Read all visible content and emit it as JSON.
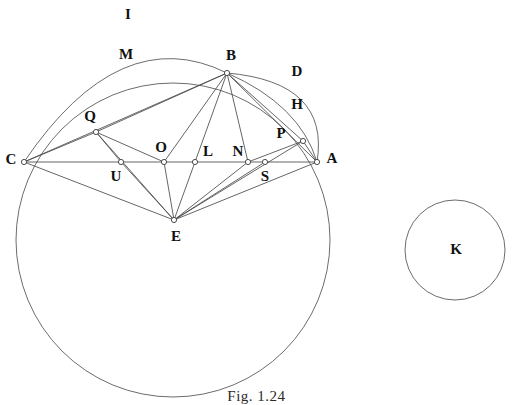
{
  "figure": {
    "caption": "Fig. 1.24",
    "stroke_color": "#4a4a4a",
    "curve_color": "#5b5b5b",
    "background_color": "#ffffff"
  },
  "points": [
    {
      "id": "A",
      "label": "A",
      "x": 317,
      "y": 162,
      "label_x": 332,
      "label_y": 160
    },
    {
      "id": "B",
      "label": "B",
      "x": 227,
      "y": 73,
      "label_x": 231,
      "label_y": 57
    },
    {
      "id": "C",
      "label": "C",
      "x": 24,
      "y": 162,
      "label_x": 11,
      "label_y": 161
    },
    {
      "id": "E",
      "label": "E",
      "x": 174,
      "y": 220,
      "label_x": 176,
      "label_y": 238
    },
    {
      "id": "L",
      "label": "L",
      "x": 195,
      "y": 162,
      "label_x": 208,
      "label_y": 153
    },
    {
      "id": "N",
      "label": "N",
      "x": 248,
      "y": 162,
      "label_x": 238,
      "label_y": 153
    },
    {
      "id": "O",
      "label": "O",
      "x": 164,
      "y": 162,
      "label_x": 161,
      "label_y": 149
    },
    {
      "id": "P",
      "label": "P",
      "x": 303,
      "y": 141,
      "label_x": 281,
      "label_y": 135
    },
    {
      "id": "Q",
      "label": "Q",
      "x": 96,
      "y": 132,
      "label_x": 90,
      "label_y": 118
    },
    {
      "id": "S",
      "label": "S",
      "x": 265,
      "y": 162,
      "label_x": 265,
      "label_y": 178
    },
    {
      "id": "U",
      "label": "U",
      "x": 121,
      "y": 162,
      "label_x": 116,
      "label_y": 178
    },
    {
      "id": "K",
      "label": "K",
      "x": 456,
      "y": 251,
      "label_x": 456,
      "label_y": 251
    }
  ],
  "segments": [
    {
      "name": "segment-C-A",
      "from": "C",
      "to": "A"
    },
    {
      "name": "segment-C-B",
      "from": "C",
      "to": "B"
    },
    {
      "name": "segment-C-E",
      "from": "C",
      "to": "E"
    },
    {
      "name": "segment-C-Q",
      "from": "C",
      "to": "Q"
    },
    {
      "name": "segment-Q-B",
      "from": "Q",
      "to": "B"
    },
    {
      "name": "segment-Q-U",
      "from": "Q",
      "to": "U"
    },
    {
      "name": "segment-Q-O",
      "from": "Q",
      "to": "O"
    },
    {
      "name": "segment-Q-E",
      "from": "Q",
      "to": "E"
    },
    {
      "name": "segment-U-E",
      "from": "U",
      "to": "E"
    },
    {
      "name": "segment-O-B",
      "from": "O",
      "to": "B"
    },
    {
      "name": "segment-O-E",
      "from": "O",
      "to": "E"
    },
    {
      "name": "segment-L-B",
      "from": "L",
      "to": "B"
    },
    {
      "name": "segment-L-E",
      "from": "L",
      "to": "E"
    },
    {
      "name": "segment-N-B",
      "from": "N",
      "to": "B"
    },
    {
      "name": "segment-N-E",
      "from": "N",
      "to": "E"
    },
    {
      "name": "segment-N-P",
      "from": "N",
      "to": "P"
    },
    {
      "name": "segment-S-E",
      "from": "S",
      "to": "E"
    },
    {
      "name": "segment-P-E",
      "from": "P",
      "to": "E"
    },
    {
      "name": "segment-P-A",
      "from": "P",
      "to": "A"
    },
    {
      "name": "segment-P-B",
      "from": "P",
      "to": "B"
    },
    {
      "name": "segment-B-A",
      "from": "B",
      "to": "A"
    },
    {
      "name": "segment-E-A",
      "from": "E",
      "to": "A"
    }
  ],
  "arcs": [
    {
      "name": "circle-I",
      "label": "I",
      "label_x": 128,
      "label_y": 16,
      "kind": "circle",
      "cx": 173,
      "cy": 240,
      "r": 157
    },
    {
      "name": "arc-M",
      "label": "M",
      "label_x": 126,
      "label_y": 56,
      "kind": "arc",
      "path": "M 24 162 Q 120 20 227 73"
    },
    {
      "name": "arc-D",
      "label": "D",
      "label_x": 297,
      "label_y": 73,
      "kind": "arc",
      "path": "M 227 73 Q 330 82 317 162"
    },
    {
      "name": "arc-H",
      "label": "H",
      "label_x": 297,
      "label_y": 106,
      "kind": "arc",
      "path": "M 227 73 Q 300 105 317 162"
    },
    {
      "name": "circle-K",
      "label": "K",
      "label_x": 456,
      "label_y": 251,
      "kind": "circle",
      "cx": 455,
      "cy": 250,
      "r": 50
    }
  ]
}
